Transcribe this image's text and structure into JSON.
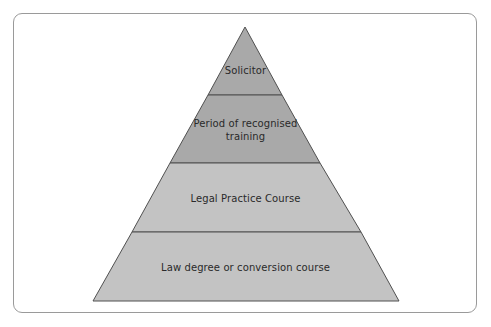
{
  "diagram": {
    "type": "pyramid",
    "tiers": [
      {
        "label_lines": [
          "Solicitor"
        ],
        "fill": "#a9a9a9"
      },
      {
        "label_lines": [
          "Period of recognised",
          "training"
        ],
        "fill": "#a9a9a9"
      },
      {
        "label_lines": [
          "Legal Practice Course"
        ],
        "fill": "#c3c3c3"
      },
      {
        "label_lines": [
          "Law degree or conversion course"
        ],
        "fill": "#c3c3c3"
      }
    ],
    "outline_color": "#505050",
    "frame_color": "#9a9a9a"
  }
}
